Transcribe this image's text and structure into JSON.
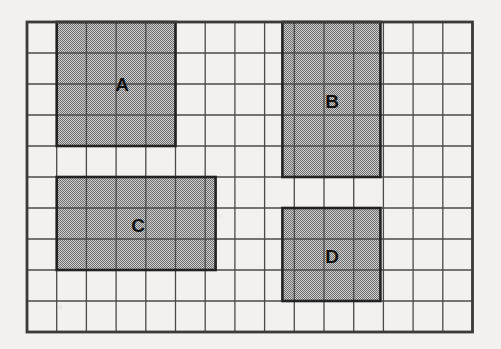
{
  "figure": {
    "background_color": "#f3f1ef",
    "frame_color": "#3a3a3a",
    "grid_line_color": "#4a4a4a",
    "shade_color": "#a9a9a9",
    "shade_pattern": "halftone-dither",
    "outline_color": "#222222"
  },
  "grid": {
    "columns": 15,
    "rows": 10,
    "origin_x": 27,
    "origin_y": 22,
    "cell_width": 29.7,
    "cell_height": 31.0,
    "label": "grid"
  },
  "rectangles": [
    {
      "label": "A",
      "col": 1,
      "row": 0,
      "width_cells": 4,
      "height_cells": 4,
      "area_cells": 16,
      "perimeter_cells": 16,
      "label_x": 122,
      "label_y": 91
    },
    {
      "label": "B",
      "col": 8.6,
      "row": 0,
      "width_cells": 3.3,
      "height_cells": 5,
      "area_cells": 15,
      "perimeter_cells": 16,
      "label_x": 332,
      "label_y": 108
    },
    {
      "label": "C",
      "col": 1,
      "row": 5,
      "width_cells": 5.35,
      "height_cells": 3,
      "area_cells": 15,
      "perimeter_cells": 16,
      "label_x": 138,
      "label_y": 232
    },
    {
      "label": "D",
      "col": 8.6,
      "row": 6,
      "width_cells": 3.3,
      "height_cells": 3,
      "area_cells": 9,
      "perimeter_cells": 12,
      "label_x": 332,
      "label_y": 263
    }
  ]
}
